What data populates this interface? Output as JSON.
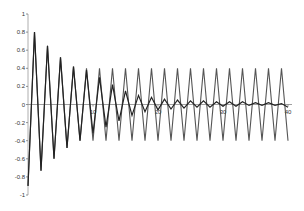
{
  "chart_data": {
    "type": "line",
    "title": "",
    "xlabel": "",
    "ylabel": "",
    "xlim": [
      0,
      40
    ],
    "ylim": [
      -1,
      1
    ],
    "grid": false,
    "legend": null,
    "x_ticks": [
      "10",
      "20",
      "30",
      "40"
    ],
    "y_ticks": [
      "1",
      "0.8",
      "0.6",
      "0.4",
      "0.2",
      "0",
      "-0.2",
      "-0.4",
      "-0.6",
      "-0.8",
      "-1"
    ],
    "x": [
      0,
      1,
      2,
      3,
      4,
      5,
      6,
      7,
      8,
      9,
      10,
      11,
      12,
      13,
      14,
      15,
      16,
      17,
      18,
      19,
      20,
      21,
      22,
      23,
      24,
      25,
      26,
      27,
      28,
      29,
      30,
      31,
      32,
      33,
      34,
      35,
      36,
      37,
      38,
      39,
      40
    ],
    "series": [
      {
        "name": "oscillating",
        "color": "#555555",
        "values": [
          -0.9,
          0.8,
          -0.73,
          0.65,
          -0.6,
          0.52,
          -0.48,
          0.42,
          -0.4,
          0.4,
          -0.4,
          0.4,
          -0.4,
          0.4,
          -0.4,
          0.4,
          -0.4,
          0.4,
          -0.4,
          0.4,
          -0.4,
          0.4,
          -0.4,
          0.4,
          -0.4,
          0.4,
          -0.4,
          0.4,
          -0.4,
          0.4,
          -0.4,
          0.4,
          -0.4,
          0.4,
          -0.4,
          0.4,
          -0.4,
          0.4,
          -0.4,
          0.4,
          -0.4
        ]
      },
      {
        "name": "damped",
        "color": "#222222",
        "values": [
          -0.9,
          0.8,
          -0.73,
          0.65,
          -0.6,
          0.52,
          -0.48,
          0.42,
          -0.4,
          0.38,
          -0.32,
          0.3,
          -0.25,
          0.22,
          -0.18,
          0.15,
          -0.12,
          0.1,
          -0.08,
          0.08,
          -0.06,
          0.06,
          -0.05,
          0.05,
          -0.04,
          0.04,
          -0.03,
          0.04,
          -0.03,
          0.03,
          -0.02,
          0.03,
          -0.02,
          0.03,
          -0.01,
          0.02,
          -0.01,
          0.02,
          -0.01,
          0.01,
          -0.03
        ]
      }
    ]
  },
  "axes": {
    "x_tick_labels": [
      "10",
      "20",
      "30",
      "40"
    ],
    "y_tick_labels": [
      "1",
      "0.8",
      "0.6",
      "0.4",
      "0.2",
      "0",
      "-0.2",
      "-0.4",
      "-0.6",
      "-0.8",
      "-1"
    ]
  }
}
